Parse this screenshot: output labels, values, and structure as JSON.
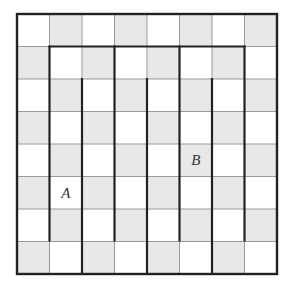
{
  "diagram": {
    "type": "grid-maze",
    "rows": 8,
    "cols": 8,
    "origin": {
      "x": 17,
      "y": 14
    },
    "cell_size": 32.5,
    "colors": {
      "light": "#ffffff",
      "dark": "#e8e8e8",
      "thin_line": "#9a9a9a",
      "thick_line": "#222222"
    },
    "checker_rule": "gray when (row+col) is odd",
    "labels": [
      {
        "text": "A",
        "row": 5,
        "col": 1
      },
      {
        "text": "B",
        "row": 4,
        "col": 5
      }
    ],
    "thick_horizontal": [
      {
        "row_line": 1,
        "col_from": 1,
        "col_to": 7
      }
    ],
    "thick_vertical": [
      {
        "col_line": 1,
        "row_from": 1,
        "row_to": 7
      },
      {
        "col_line": 2,
        "row_from": 2,
        "row_to": 8
      },
      {
        "col_line": 3,
        "row_from": 1,
        "row_to": 7
      },
      {
        "col_line": 4,
        "row_from": 2,
        "row_to": 8
      },
      {
        "col_line": 5,
        "row_from": 1,
        "row_to": 7
      },
      {
        "col_line": 6,
        "row_from": 2,
        "row_to": 8
      },
      {
        "col_line": 7,
        "row_from": 1,
        "row_to": 7
      }
    ]
  }
}
